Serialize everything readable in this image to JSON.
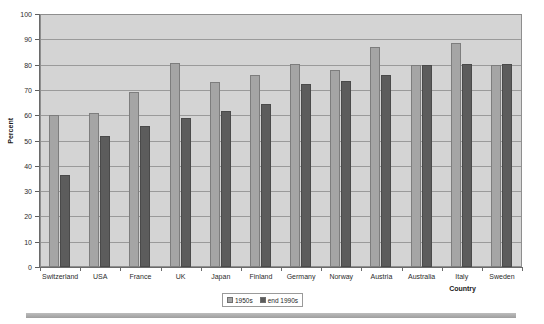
{
  "chart_data": {
    "type": "bar",
    "title": "",
    "xlabel": "Country",
    "ylabel": "Percent",
    "ylim": [
      0,
      100
    ],
    "ytick_step": 10,
    "yticks": [
      0,
      10,
      20,
      30,
      40,
      50,
      60,
      70,
      80,
      90,
      100
    ],
    "grid": true,
    "legend_position": "bottom",
    "categories": [
      "Switzerland",
      "USA",
      "France",
      "UK",
      "Japan",
      "Finland",
      "Germany",
      "Norway",
      "Austria",
      "Australia",
      "Italy",
      "Sweden"
    ],
    "series": [
      {
        "name": "1950s",
        "color": "#a5a5a5",
        "values": [
          60.5,
          61,
          69.5,
          81,
          73.5,
          76,
          80.5,
          78,
          87.5,
          80,
          89,
          80
        ]
      },
      {
        "name": "end 1990s",
        "color": "#5c5c5c",
        "values": [
          36.5,
          52,
          56,
          59,
          62,
          64.5,
          72.5,
          74,
          76,
          80,
          80.5,
          80.5
        ]
      }
    ]
  },
  "legend": {
    "items": [
      {
        "label": "1950s",
        "swatch": "s1"
      },
      {
        "label": "end 1990s",
        "swatch": "s2"
      }
    ]
  },
  "axes": {
    "y_title": "Percent",
    "x_title": "Country"
  },
  "colors": {
    "plot_background": "#d4d4d4",
    "gridline": "#9a9a9a",
    "axis": "#6a6a6a",
    "series_1": "#a5a5a5",
    "series_2": "#5c5c5c",
    "page_background": "#ffffff"
  }
}
